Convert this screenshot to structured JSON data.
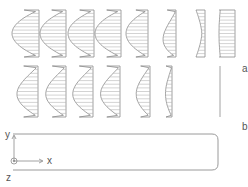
{
  "figure": {
    "row_labels": {
      "a": "a",
      "b": "b"
    },
    "axes": {
      "x": "x",
      "y": "y",
      "z": "z"
    },
    "colors": {
      "line": "#8a8a8a",
      "hatch": "#b5b5b5",
      "channel": "#9a9a9a",
      "text": "#555555"
    },
    "row_a": [
      {
        "right": 39,
        "bulge": 27,
        "shape": "parabola"
      },
      {
        "right": 66,
        "bulge": 26,
        "shape": "parabola"
      },
      {
        "right": 94,
        "bulge": 26,
        "shape": "parabola"
      },
      {
        "right": 121,
        "bulge": 26,
        "shape": "parabola"
      },
      {
        "right": 148,
        "bulge": 22,
        "shape": "parabola"
      },
      {
        "right": 176,
        "bulge": 16,
        "shape": "s-curve"
      },
      {
        "right": 205,
        "bulge": 9,
        "shape": "concave"
      },
      {
        "right": 235,
        "bulge": 16,
        "shape": "plug"
      }
    ],
    "row_b": [
      {
        "right": 38,
        "bulge": 26,
        "shape": "half-parabola"
      },
      {
        "right": 66,
        "bulge": 25,
        "shape": "half-parabola"
      },
      {
        "right": 93,
        "bulge": 25,
        "shape": "half-parabola"
      },
      {
        "right": 120,
        "bulge": 24,
        "shape": "half-parabola"
      },
      {
        "right": 150,
        "bulge": 17,
        "shape": "half-parabola"
      },
      {
        "right": 172,
        "bulge": 8,
        "shape": "half-parabola"
      },
      {
        "right": 220,
        "bulge": 0,
        "shape": "line"
      }
    ]
  }
}
